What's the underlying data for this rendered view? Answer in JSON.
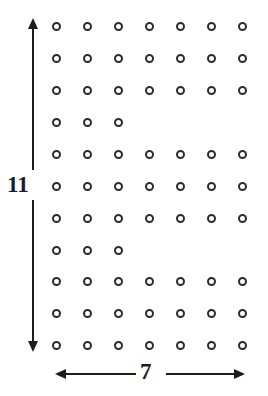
{
  "figure": {
    "background_color": "#ffffff",
    "ink_color": "#1d1d1d",
    "dot_color": "#2b2b2b",
    "width": 268,
    "height": 396
  },
  "vertical_dimension": {
    "label": "11",
    "unit_count": 11,
    "orientation": "vertical",
    "arrow_style": "double-headed",
    "line_x": 32,
    "top_y": 18,
    "bottom_y": 352,
    "label_x": 7,
    "label_y": 173
  },
  "horizontal_dimension": {
    "label": "7",
    "unit_count": 7,
    "orientation": "horizontal",
    "arrow_style": "double-headed",
    "line_y": 373,
    "left_x": 55,
    "right_x": 245,
    "label_x": 140,
    "label_y": 360
  },
  "chart_data": {
    "type": "scatter",
    "xlabel": "7",
    "ylabel": "11",
    "grid": false,
    "legend": null,
    "rows": 11,
    "columns": 7,
    "column_x": [
      56,
      87,
      118,
      149,
      180,
      211,
      242
    ],
    "row_y": [
      26,
      58,
      90,
      122,
      154,
      186,
      218,
      250,
      281,
      313,
      345
    ],
    "column_spacing": 31,
    "row_spacing": 32,
    "marker": "open-circle",
    "marker_diameter": 9,
    "marker_stroke": 2,
    "row_dot_counts": [
      7,
      7,
      7,
      3,
      7,
      7,
      7,
      3,
      7,
      7,
      7
    ],
    "total_dots": 69,
    "short_rows": [
      4,
      8
    ],
    "rows_detail": [
      {
        "row": 1,
        "y": 26,
        "dots": 7,
        "columns": [
          1,
          2,
          3,
          4,
          5,
          6,
          7
        ]
      },
      {
        "row": 2,
        "y": 58,
        "dots": 7,
        "columns": [
          1,
          2,
          3,
          4,
          5,
          6,
          7
        ]
      },
      {
        "row": 3,
        "y": 90,
        "dots": 7,
        "columns": [
          1,
          2,
          3,
          4,
          5,
          6,
          7
        ]
      },
      {
        "row": 4,
        "y": 122,
        "dots": 3,
        "columns": [
          1,
          2,
          3
        ]
      },
      {
        "row": 5,
        "y": 154,
        "dots": 7,
        "columns": [
          1,
          2,
          3,
          4,
          5,
          6,
          7
        ]
      },
      {
        "row": 6,
        "y": 186,
        "dots": 7,
        "columns": [
          1,
          2,
          3,
          4,
          5,
          6,
          7
        ]
      },
      {
        "row": 7,
        "y": 218,
        "dots": 7,
        "columns": [
          1,
          2,
          3,
          4,
          5,
          6,
          7
        ]
      },
      {
        "row": 8,
        "y": 250,
        "dots": 3,
        "columns": [
          1,
          2,
          3
        ]
      },
      {
        "row": 9,
        "y": 281,
        "dots": 7,
        "columns": [
          1,
          2,
          3,
          4,
          5,
          6,
          7
        ]
      },
      {
        "row": 10,
        "y": 313,
        "dots": 7,
        "columns": [
          1,
          2,
          3,
          4,
          5,
          6,
          7
        ]
      },
      {
        "row": 11,
        "y": 345,
        "dots": 7,
        "columns": [
          1,
          2,
          3,
          4,
          5,
          6,
          7
        ]
      }
    ],
    "xlim": [
      0,
      8
    ],
    "ylim": [
      0,
      12
    ]
  }
}
